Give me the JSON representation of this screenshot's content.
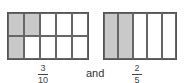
{
  "figures": [
    {
      "id": "fraction-3-10",
      "rows": 2,
      "cols": 5,
      "shaded": [
        [
          1,
          1,
          0,
          0,
          0
        ],
        [
          1,
          0,
          0,
          0,
          0
        ]
      ],
      "numerator": "3",
      "denominator": "10"
    },
    {
      "id": "fraction-2-5",
      "rows": 1,
      "cols": 5,
      "shaded": [
        [
          1,
          1,
          0,
          0,
          0
        ]
      ],
      "numerator": "2",
      "denominator": "5"
    }
  ],
  "connector": "and",
  "colors": {
    "shaded": "#c9c9c9",
    "border": "#555555"
  }
}
